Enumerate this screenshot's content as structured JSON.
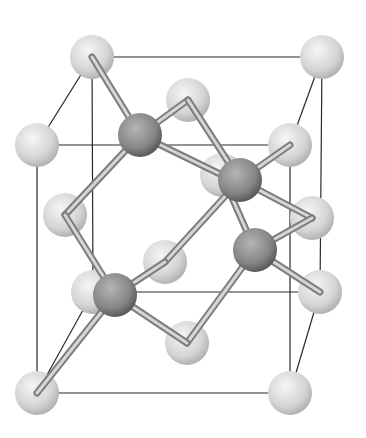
{
  "colors": {
    "background": "#ffffff",
    "edge": "#2a2a2a",
    "bond_dark": "#7d7d7d",
    "bond_light": "#d6d6d6",
    "light_atom_center": "#f2f2f2",
    "light_atom_edge": "#b3b3b3",
    "dark_atom_center": "#a9a9a9",
    "dark_atom_edge": "#5a5a5a"
  },
  "light_atoms": [
    {
      "id": "back-top-left",
      "x": 92,
      "y": 57
    },
    {
      "id": "back-top-right",
      "x": 322,
      "y": 57
    },
    {
      "id": "face-top",
      "x": 188,
      "y": 100
    },
    {
      "id": "front-top-left",
      "x": 37,
      "y": 145
    },
    {
      "id": "front-top-right",
      "x": 290,
      "y": 145
    },
    {
      "id": "face-back",
      "x": 222,
      "y": 175
    },
    {
      "id": "face-left",
      "x": 65,
      "y": 215
    },
    {
      "id": "face-right",
      "x": 312,
      "y": 218
    },
    {
      "id": "face-front",
      "x": 165,
      "y": 262
    },
    {
      "id": "back-bottom-left",
      "x": 93,
      "y": 292
    },
    {
      "id": "back-bottom-right",
      "x": 320,
      "y": 292
    },
    {
      "id": "face-bottom",
      "x": 187,
      "y": 343
    },
    {
      "id": "front-bottom-left",
      "x": 37,
      "y": 393
    },
    {
      "id": "front-bottom-right",
      "x": 290,
      "y": 393
    }
  ],
  "dark_atoms": [
    {
      "id": "tetra-1",
      "x": 140,
      "y": 135
    },
    {
      "id": "tetra-2",
      "x": 240,
      "y": 180
    },
    {
      "id": "tetra-3",
      "x": 255,
      "y": 250
    },
    {
      "id": "tetra-4",
      "x": 115,
      "y": 295
    }
  ],
  "cube_edges": [
    [
      92,
      57,
      322,
      57
    ],
    [
      92,
      57,
      93,
      292
    ],
    [
      322,
      57,
      320,
      292
    ],
    [
      93,
      292,
      320,
      292
    ],
    [
      37,
      145,
      290,
      145
    ],
    [
      37,
      145,
      37,
      393
    ],
    [
      290,
      145,
      290,
      393
    ],
    [
      37,
      393,
      290,
      393
    ],
    [
      92,
      57,
      37,
      145
    ],
    [
      322,
      57,
      290,
      145
    ],
    [
      93,
      292,
      37,
      393
    ],
    [
      320,
      292,
      290,
      393
    ]
  ],
  "bonds": [
    [
      140,
      135,
      92,
      57
    ],
    [
      140,
      135,
      188,
      100
    ],
    [
      140,
      135,
      65,
      215
    ],
    [
      140,
      135,
      222,
      175
    ],
    [
      240,
      180,
      188,
      100
    ],
    [
      240,
      180,
      290,
      145
    ],
    [
      240,
      180,
      165,
      262
    ],
    [
      240,
      180,
      312,
      218
    ],
    [
      255,
      250,
      222,
      175
    ],
    [
      255,
      250,
      312,
      218
    ],
    [
      255,
      250,
      187,
      343
    ],
    [
      255,
      250,
      320,
      292
    ],
    [
      115,
      295,
      65,
      215
    ],
    [
      115,
      295,
      165,
      262
    ],
    [
      115,
      295,
      37,
      393
    ],
    [
      115,
      295,
      187,
      343
    ]
  ]
}
